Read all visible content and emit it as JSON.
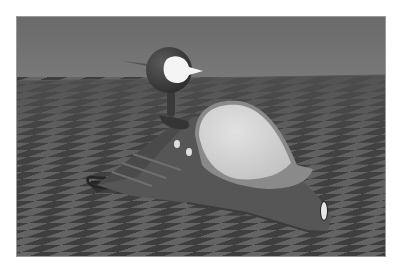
{
  "image": {
    "description": "Grayscale 3D render of a cartoon figure seated in a futuristic sled-like vehicle on a checkerboard ground plane",
    "colors": {
      "page_bg": "#ffffff",
      "sky": "#707070",
      "ground_light": "#6a6a6a",
      "ground_dark": "#3e3e3e",
      "vehicle_body": "#555555",
      "canopy": "#d8d8d8",
      "canopy_rim": "#8a8a8a",
      "head": "#4a4a4a",
      "face": "#f4f4f4",
      "lights": "#e0e0e0"
    }
  }
}
